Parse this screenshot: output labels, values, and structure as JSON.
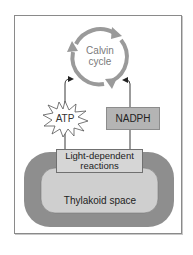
{
  "diagram": {
    "calvin_cycle": {
      "line1": "Calvin",
      "line2": "cycle"
    },
    "atp": {
      "label": "ATP"
    },
    "nadph": {
      "label": "NADPH"
    },
    "light_dependent": {
      "line1": "Light-dependent",
      "line2": "reactions"
    },
    "thylakoid": {
      "label": "Thylakoid space"
    },
    "colors": {
      "cycle_ring": "#9a9a9a",
      "thylakoid_membrane": "#8e8e8e",
      "thylakoid_space": "#cfcfcf",
      "light_box": "#d6d6d6",
      "nadph_box": "#b4b4b4",
      "frame_border": "#8a8a8a"
    }
  }
}
